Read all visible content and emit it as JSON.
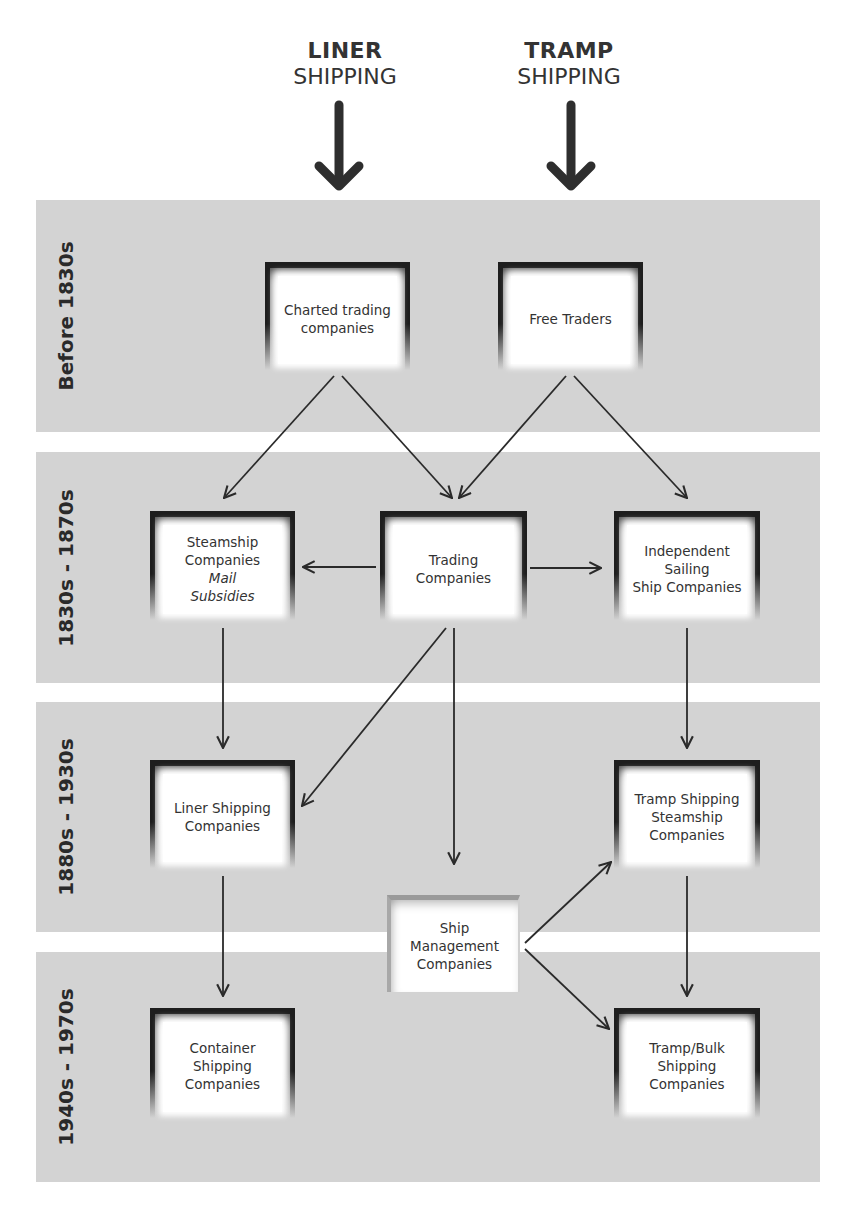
{
  "headers": [
    {
      "bold": "LINER",
      "light": "SHIPPING"
    },
    {
      "bold": "TRAMP",
      "light": "SHIPPING"
    }
  ],
  "bands": [
    {
      "label": "Before 1830s"
    },
    {
      "label": "1830s - 1870s"
    },
    {
      "label": "1880s - 1930s"
    },
    {
      "label": "1940s - 1970s"
    }
  ],
  "nodes": {
    "charted": {
      "line1": "Charted trading",
      "line2": "companies"
    },
    "free_traders": {
      "line1": "Free Traders"
    },
    "steamship": {
      "line1": "Steamship",
      "line2": "Companies",
      "note1": "Mail",
      "note2": "Subsidies"
    },
    "trading": {
      "line1": "Trading",
      "line2": "Companies"
    },
    "independent": {
      "line1": "Independent",
      "line2": "Sailing",
      "line3": "Ship Companies"
    },
    "liner": {
      "line1": "Liner Shipping",
      "line2": "Companies"
    },
    "tramp_steam": {
      "line1": "Tramp Shipping",
      "line2": "Steamship",
      "line3": "Companies"
    },
    "ship_mgmt": {
      "line1": "Ship",
      "line2": "Management",
      "line3": "Companies"
    },
    "container": {
      "line1": "Container",
      "line2": "Shipping",
      "line3": "Companies"
    },
    "tramp_bulk": {
      "line1": "Tramp/Bulk",
      "line2": "Shipping",
      "line3": "Companies"
    }
  },
  "edges": [
    {
      "from": "LINER SHIPPING",
      "to": "Charted trading companies"
    },
    {
      "from": "TRAMP SHIPPING",
      "to": "Free Traders"
    },
    {
      "from": "Charted trading companies",
      "to": "Steamship Companies"
    },
    {
      "from": "Charted trading companies",
      "to": "Trading Companies"
    },
    {
      "from": "Free Traders",
      "to": "Trading Companies"
    },
    {
      "from": "Free Traders",
      "to": "Independent Sailing Ship Companies"
    },
    {
      "from": "Trading Companies",
      "to": "Steamship Companies"
    },
    {
      "from": "Trading Companies",
      "to": "Independent Sailing Ship Companies"
    },
    {
      "from": "Steamship Companies",
      "to": "Liner Shipping Companies"
    },
    {
      "from": "Trading Companies",
      "to": "Liner Shipping Companies"
    },
    {
      "from": "Trading Companies",
      "to": "Ship Management Companies"
    },
    {
      "from": "Independent Sailing Ship Companies",
      "to": "Tramp Shipping Steamship Companies"
    },
    {
      "from": "Ship Management Companies",
      "to": "Tramp Shipping Steamship Companies"
    },
    {
      "from": "Ship Management Companies",
      "to": "Tramp/Bulk Shipping Companies"
    },
    {
      "from": "Liner Shipping Companies",
      "to": "Container Shipping Companies"
    },
    {
      "from": "Tramp Shipping Steamship Companies",
      "to": "Tramp/Bulk Shipping Companies"
    }
  ],
  "colors": {
    "band": "#d3d3d3",
    "frame": "#1e1e1e",
    "line": "#2a2a2a"
  }
}
